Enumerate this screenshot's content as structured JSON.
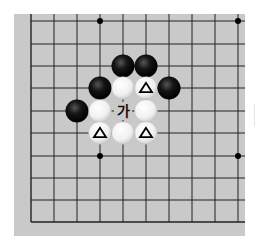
{
  "diagram": {
    "type": "go-board-fragment",
    "grid": {
      "cols": 10,
      "rows": 10,
      "col_x": [
        31,
        54,
        77,
        100,
        123,
        146,
        169,
        192,
        215,
        238
      ],
      "row_y": [
        21,
        44,
        66,
        88,
        111,
        133,
        156,
        178,
        200,
        222
      ],
      "left_edge": true,
      "bottom_edge": true
    },
    "star_points": [
      {
        "col": 3,
        "row": 0
      },
      {
        "col": 9,
        "row": 0
      },
      {
        "col": 3,
        "row": 6
      },
      {
        "col": 9,
        "row": 6
      }
    ],
    "stones": [
      {
        "color": "black",
        "col": 4,
        "row": 2
      },
      {
        "color": "black",
        "col": 5,
        "row": 2
      },
      {
        "color": "black",
        "col": 3,
        "row": 3
      },
      {
        "color": "white",
        "col": 4,
        "row": 3
      },
      {
        "color": "white",
        "col": 5,
        "row": 3,
        "mark": "triangle"
      },
      {
        "color": "black",
        "col": 6,
        "row": 3
      },
      {
        "color": "black",
        "col": 2,
        "row": 4
      },
      {
        "color": "white",
        "col": 3,
        "row": 4
      },
      {
        "color": "white",
        "col": 5,
        "row": 4
      },
      {
        "color": "white",
        "col": 3,
        "row": 5,
        "mark": "triangle"
      },
      {
        "color": "white",
        "col": 4,
        "row": 5
      },
      {
        "color": "white",
        "col": 5,
        "row": 5,
        "mark": "triangle"
      }
    ],
    "labels": [
      {
        "text": "가",
        "col": 4,
        "row": 4
      }
    ],
    "colors": {
      "board": "#c9c9c9",
      "line": "#222222",
      "black_stone": "#111111",
      "white_stone": "#f4f4f4"
    }
  }
}
